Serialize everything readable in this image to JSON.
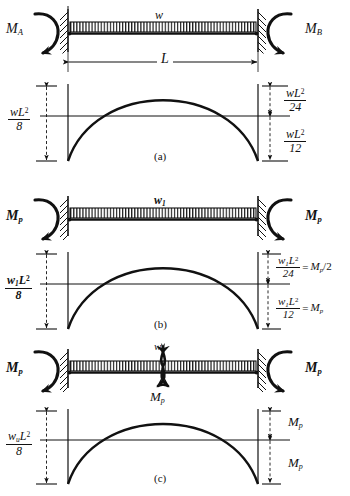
{
  "figure": {
    "ink_color": "#111111",
    "panels": [
      {
        "id": "a",
        "caption": "(a)",
        "beam": {
          "load_label": "w",
          "span_label": "L",
          "left_moment_label": "M",
          "left_moment_sub": "A",
          "right_moment_label": "M",
          "right_moment_sub": "B",
          "left_support": "fixed",
          "right_support": "fixed"
        },
        "moment_diagram": {
          "left_dimension": {
            "numerator": "wL2",
            "num_w": "w",
            "num_L": "L",
            "num_exp": "2",
            "denominator": "8"
          },
          "right_upper_dimension": {
            "num_w": "w",
            "num_L": "L",
            "num_exp": "2",
            "denominator": "24",
            "equals": ""
          },
          "right_lower_dimension": {
            "num_w": "w",
            "num_L": "L",
            "num_exp": "2",
            "denominator": "12",
            "equals": ""
          }
        }
      },
      {
        "id": "b",
        "caption": "(b)",
        "beam": {
          "load_label": "w",
          "load_sub": "1",
          "span_label": "",
          "left_moment_label": "M",
          "left_moment_sub": "p",
          "right_moment_label": "M",
          "right_moment_sub": "p",
          "left_support": "fixed",
          "right_support": "fixed"
        },
        "moment_diagram": {
          "left_dimension": {
            "num_w": "w",
            "num_w_sub": "1",
            "num_L": "L",
            "num_exp": "2",
            "denominator": "8"
          },
          "right_upper_dimension": {
            "num_w": "w",
            "num_w_sub": "1",
            "num_L": "L",
            "num_exp": "2",
            "denominator": "24",
            "equals": "=",
            "equals_rhs": "M",
            "equals_rhs_sub": "p",
            "equals_rhs_tail": "/2"
          },
          "right_lower_dimension": {
            "num_w": "w",
            "num_w_sub": "1",
            "num_L": "L",
            "num_exp": "2",
            "denominator": "12",
            "equals": "=",
            "equals_rhs": "M",
            "equals_rhs_sub": "p",
            "equals_rhs_tail": ""
          }
        }
      },
      {
        "id": "c",
        "caption": "(c)",
        "beam": {
          "load_label": "w",
          "load_sub": "u",
          "span_label": "",
          "left_moment_label": "M",
          "left_moment_sub": "p",
          "right_moment_label": "M",
          "right_moment_sub": "p",
          "hinge_label": "M",
          "hinge_label_sub": "p",
          "hinge_symbol": "plastic-hinge-bowtie",
          "left_support": "fixed",
          "right_support": "fixed"
        },
        "moment_diagram": {
          "left_dimension": {
            "num_w": "w",
            "num_w_sub": "u",
            "num_L": "L",
            "num_exp": "2",
            "denominator": "8"
          },
          "right_upper_dimension": {
            "label": "M",
            "label_sub": "p"
          },
          "right_lower_dimension": {
            "label": "M",
            "label_sub": "p"
          }
        }
      }
    ]
  }
}
